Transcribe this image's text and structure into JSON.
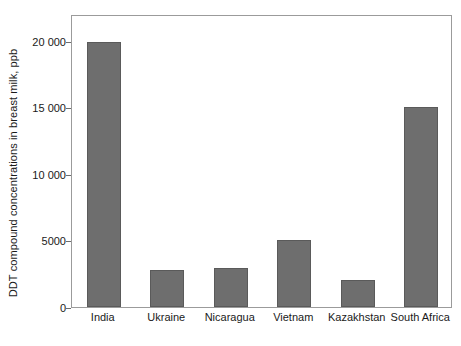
{
  "chart_data": {
    "type": "bar",
    "title": "",
    "subtitle": "",
    "xlabel": "",
    "ylabel": "DDT compound concentrations in breast milk, ppb",
    "categories": [
      "India",
      "Ukraine",
      "Nicaragua",
      "Vietnam",
      "Kazakhstan",
      "South Africa"
    ],
    "values": [
      19900,
      2750,
      2900,
      5000,
      2000,
      15000
    ],
    "ylim": [
      0,
      22000
    ],
    "yticks": [
      0,
      5000,
      10000,
      15000,
      20000
    ],
    "ytick_labels": [
      "0",
      "5000",
      "10 000",
      "15 000",
      "20 000"
    ],
    "grid": false,
    "legend": null,
    "bar_color": "#6e6e6e",
    "bar_edge_color": "#5a5a5a",
    "frame_color": "#9b9b9b",
    "background": "#ffffff"
  }
}
